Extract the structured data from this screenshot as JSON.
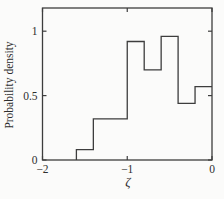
{
  "chart_data": {
    "type": "bar",
    "subtype": "step-histogram",
    "title": "",
    "xlabel": "ζ",
    "ylabel": "Probability density",
    "xlim": [
      -2,
      0
    ],
    "ylim": [
      0,
      1.18
    ],
    "grid": false,
    "legend": null,
    "tick_style": "inward-mirrored",
    "x_ticks": {
      "values": [
        -2,
        -1,
        0
      ],
      "labels": [
        "−2",
        "−1",
        "0"
      ]
    },
    "y_ticks": {
      "values": [
        0,
        0.5,
        1
      ],
      "labels": [
        "0",
        "0.5",
        "1"
      ]
    },
    "bin_edges": [
      -1.6,
      -1.4,
      -1.2,
      -1.0,
      -0.8,
      -0.6,
      -0.4,
      -0.2,
      0.0
    ],
    "values": [
      0.08,
      0.32,
      0.32,
      0.92,
      0.7,
      0.96,
      0.44,
      0.57
    ],
    "line_color": "#3d3d3d",
    "text_color": "#2e2e2e",
    "background": "#fbfbfa"
  }
}
